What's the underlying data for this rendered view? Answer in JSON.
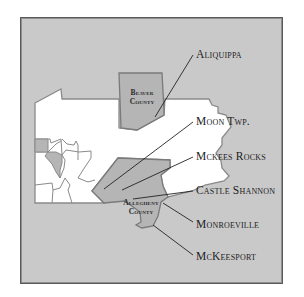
{
  "map": {
    "colors": {
      "background": "#c9c9c9",
      "state_fill": "#ffffff",
      "highlight_fill": "#b5b5b5",
      "border": "#7a7a7a",
      "leader_line": "#222222",
      "frame_border": "#5a5a5a"
    },
    "counties": [
      {
        "id": "beaver",
        "label_line1": "Beaver",
        "label_line2": "County"
      },
      {
        "id": "allegheny",
        "label_line1": "Allegheny",
        "label_line2": "County"
      }
    ],
    "places": [
      {
        "id": "aliquippa",
        "label": "Aliquippa"
      },
      {
        "id": "moon-twp",
        "label": "Moon Twp."
      },
      {
        "id": "mckees-rocks",
        "label": "Mckees Rocks"
      },
      {
        "id": "castle-shannon",
        "label": "Castle Shannon"
      },
      {
        "id": "monroeville",
        "label": "Monroeville"
      },
      {
        "id": "mckeesport",
        "label": "McKeesport"
      }
    ]
  }
}
